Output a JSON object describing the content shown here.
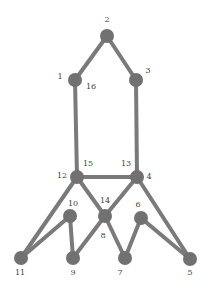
{
  "diagram": {
    "type": "graph",
    "colors": {
      "node": "#717171",
      "edge": "#7a7a7a",
      "label": "#444444",
      "background": "#ffffff"
    },
    "nodes": [
      {
        "id": "2",
        "x": 107,
        "y": 36
      },
      {
        "id": "1",
        "x": 75,
        "y": 80
      },
      {
        "id": "3",
        "x": 136,
        "y": 80
      },
      {
        "id": "12",
        "x": 77,
        "y": 177
      },
      {
        "id": "4",
        "x": 137,
        "y": 177
      },
      {
        "id": "14",
        "x": 105,
        "y": 216
      },
      {
        "id": "10",
        "x": 70,
        "y": 216
      },
      {
        "id": "6",
        "x": 141,
        "y": 218
      },
      {
        "id": "11",
        "x": 21,
        "y": 258
      },
      {
        "id": "9",
        "x": 73,
        "y": 258
      },
      {
        "id": "7",
        "x": 125,
        "y": 258
      },
      {
        "id": "5",
        "x": 190,
        "y": 259
      }
    ],
    "edges": [
      [
        "2",
        "1"
      ],
      [
        "2",
        "3"
      ],
      [
        "1",
        "12"
      ],
      [
        "3",
        "4"
      ],
      [
        "12",
        "4"
      ],
      [
        "12",
        "11"
      ],
      [
        "12",
        "14"
      ],
      [
        "4",
        "14"
      ],
      [
        "4",
        "5"
      ],
      [
        "10",
        "11"
      ],
      [
        "10",
        "9"
      ],
      [
        "14",
        "9"
      ],
      [
        "14",
        "7"
      ],
      [
        "6",
        "7"
      ],
      [
        "6",
        "5"
      ]
    ],
    "labels": [
      {
        "text": "2",
        "x": 107,
        "y": 22
      },
      {
        "text": "1",
        "x": 60,
        "y": 79
      },
      {
        "text": "16",
        "x": 91,
        "y": 89
      },
      {
        "text": "3",
        "x": 148,
        "y": 73
      },
      {
        "text": "15",
        "x": 88,
        "y": 166
      },
      {
        "text": "12",
        "x": 62,
        "y": 178
      },
      {
        "text": "13",
        "x": 126,
        "y": 166
      },
      {
        "text": "4",
        "x": 149,
        "y": 179
      },
      {
        "text": "14",
        "x": 105,
        "y": 203
      },
      {
        "text": "10",
        "x": 73,
        "y": 206
      },
      {
        "text": "6",
        "x": 138,
        "y": 207
      },
      {
        "text": "8",
        "x": 103,
        "y": 238
      },
      {
        "text": "11",
        "x": 20,
        "y": 275
      },
      {
        "text": "9",
        "x": 73,
        "y": 275
      },
      {
        "text": "7",
        "x": 120,
        "y": 275
      },
      {
        "text": "5",
        "x": 190,
        "y": 275
      }
    ]
  }
}
